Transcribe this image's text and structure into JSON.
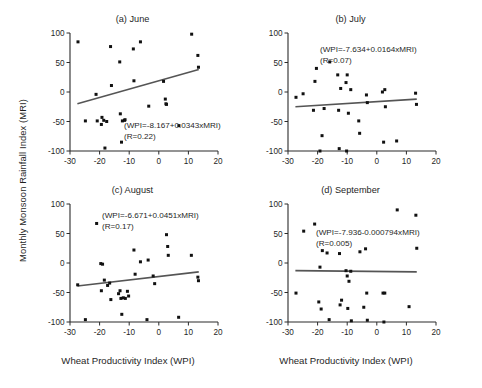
{
  "figure": {
    "xlabel": "Wheat Productivity Index (WPI)",
    "ylabel": "Monthly Monsoon Rainfall Index (MRI)",
    "axis_color": "#2b2b2b",
    "point_color": "#111111",
    "line_color": "#555555"
  },
  "chart_data": [
    {
      "type": "scatter",
      "title": "(a)  June",
      "panel_letter": "(a)",
      "month": "June",
      "xlabel": "Wheat Productivity Index (WPI)",
      "ylabel": "Monthly Monsoon Rainfall Index (MRI)",
      "xlim": [
        -30,
        20
      ],
      "ylim": [
        -100,
        100
      ],
      "xticks": [
        -30,
        -20,
        -10,
        0,
        10,
        20
      ],
      "yticks": [
        -100,
        -50,
        0,
        50,
        100
      ],
      "grid": false,
      "equation": "(WPI=-8.167+0.0343xMRI)",
      "r_text": "(R=0.22)",
      "r_value": 0.22,
      "fit_intercept": -8.167,
      "fit_slope": 0.0343,
      "trendline": {
        "x0": -27.5,
        "y0": -20,
        "x1": 13.5,
        "y1": 38
      },
      "points": [
        [
          -27.3,
          85
        ],
        [
          -24.8,
          -49
        ],
        [
          -21.2,
          -4
        ],
        [
          -20.8,
          -49
        ],
        [
          -19.4,
          -55
        ],
        [
          -19.2,
          -43
        ],
        [
          -18.6,
          -48
        ],
        [
          -18.2,
          -95
        ],
        [
          -17.6,
          -50
        ],
        [
          -16.3,
          77
        ],
        [
          -16.0,
          11
        ],
        [
          -13.2,
          51
        ],
        [
          -13.0,
          -37
        ],
        [
          -12.6,
          -85
        ],
        [
          -12.3,
          -49
        ],
        [
          -11.6,
          -48
        ],
        [
          -11.4,
          -47
        ],
        [
          -8.6,
          73
        ],
        [
          -8.4,
          19
        ],
        [
          -6.2,
          85
        ],
        [
          -3.4,
          -24
        ],
        [
          1.6,
          18
        ],
        [
          2.2,
          -12
        ],
        [
          2.4,
          -20
        ],
        [
          2.6,
          -21
        ],
        [
          6.8,
          -57
        ],
        [
          11.1,
          98
        ],
        [
          13.2,
          62
        ],
        [
          13.4,
          42
        ]
      ]
    },
    {
      "type": "scatter",
      "title": "(b)  July",
      "panel_letter": "(b)",
      "month": "July",
      "xlabel": "Wheat Productivity Index (WPI)",
      "ylabel": "Monthly Monsoon Rainfall Index (MRI)",
      "xlim": [
        -30,
        20
      ],
      "ylim": [
        -100,
        100
      ],
      "xticks": [
        -30,
        -20,
        -10,
        0,
        10,
        20
      ],
      "yticks": [
        -100,
        -50,
        0,
        50,
        100
      ],
      "grid": false,
      "equation": "(WPI=-7.634+0.0164xMRI)",
      "r_text": "(R=0.07)",
      "r_value": 0.07,
      "fit_intercept": -7.634,
      "fit_slope": 0.0164,
      "trendline": {
        "x0": -27.5,
        "y0": -25,
        "x1": 13.5,
        "y1": -12
      },
      "points": [
        [
          -27.3,
          -9
        ],
        [
          -24.9,
          -3
        ],
        [
          -21.4,
          -31
        ],
        [
          -20.9,
          18
        ],
        [
          -20.4,
          40
        ],
        [
          -19.2,
          -100
        ],
        [
          -18.5,
          -74
        ],
        [
          -17.8,
          -28
        ],
        [
          -15.9,
          51
        ],
        [
          -13.2,
          29
        ],
        [
          -12.9,
          -31
        ],
        [
          -12.7,
          -96
        ],
        [
          -12.2,
          6
        ],
        [
          -10.4,
          16
        ],
        [
          -10.2,
          -100
        ],
        [
          -10.0,
          29
        ],
        [
          -9.6,
          -36
        ],
        [
          -8.8,
          4
        ],
        [
          -6.1,
          -49
        ],
        [
          -5.8,
          -70
        ],
        [
          -3.5,
          -5
        ],
        [
          -3.2,
          -18
        ],
        [
          1.9,
          0
        ],
        [
          2.3,
          -85
        ],
        [
          2.7,
          4
        ],
        [
          2.9,
          -25
        ],
        [
          6.7,
          -83
        ],
        [
          13.1,
          -2
        ],
        [
          13.4,
          -21
        ]
      ]
    },
    {
      "type": "scatter",
      "title": "(c)  August",
      "panel_letter": "(c)",
      "month": "August",
      "xlabel": "Wheat Productivity Index (WPI)",
      "ylabel": "Monthly Monsoon Rainfall Index (MRI)",
      "xlim": [
        -30,
        20
      ],
      "ylim": [
        -100,
        100
      ],
      "xticks": [
        -30,
        -20,
        -10,
        0,
        10,
        20
      ],
      "yticks": [
        -100,
        -50,
        0,
        50,
        100
      ],
      "grid": false,
      "equation": "(WPI=-6.671+0.0451xMRI)",
      "r_text": "(R=0.17)",
      "r_value": 0.17,
      "fit_intercept": -6.671,
      "fit_slope": 0.0451,
      "trendline": {
        "x0": -27.5,
        "y0": -39,
        "x1": 13.5,
        "y1": -15
      },
      "points": [
        [
          -27.4,
          -37
        ],
        [
          -24.8,
          -96
        ],
        [
          -21.0,
          67
        ],
        [
          -19.6,
          -1
        ],
        [
          -19.4,
          -47
        ],
        [
          -19.0,
          -2
        ],
        [
          -18.4,
          -29
        ],
        [
          -17.3,
          -38
        ],
        [
          -16.6,
          -34
        ],
        [
          -16.2,
          -62
        ],
        [
          -13.6,
          -52
        ],
        [
          -13.1,
          -47
        ],
        [
          -12.8,
          -60
        ],
        [
          -12.5,
          -87
        ],
        [
          -12.0,
          -59
        ],
        [
          -11.3,
          -60
        ],
        [
          -10.6,
          -48
        ],
        [
          -10.2,
          -56
        ],
        [
          -8.4,
          22
        ],
        [
          -8.0,
          -19
        ],
        [
          -6.2,
          2
        ],
        [
          -4.0,
          -96
        ],
        [
          -3.6,
          5
        ],
        [
          -1.9,
          -22
        ],
        [
          -1.4,
          -35
        ],
        [
          2.6,
          48
        ],
        [
          3.0,
          28
        ],
        [
          3.2,
          13
        ],
        [
          6.7,
          -92
        ],
        [
          11.0,
          13
        ],
        [
          13.2,
          -24
        ],
        [
          13.4,
          -30
        ]
      ]
    },
    {
      "type": "scatter",
      "title": "(d)  September",
      "panel_letter": "(d)",
      "month": "September",
      "xlabel": "Wheat Productivity Index (WPI)",
      "ylabel": "Monthly Monsoon Rainfall Index (MRI)",
      "xlim": [
        -30,
        20
      ],
      "ylim": [
        -100,
        100
      ],
      "xticks": [
        -30,
        -20,
        -10,
        0,
        10,
        20
      ],
      "yticks": [
        -100,
        -50,
        0,
        50,
        100
      ],
      "grid": false,
      "equation": "(WPI=-7.936-0.000794xMRI)",
      "r_text": "(R=0.005)",
      "r_value": 0.005,
      "fit_intercept": -7.936,
      "fit_slope": -0.000794,
      "trendline": {
        "x0": -27.5,
        "y0": -13,
        "x1": 13.5,
        "y1": -15
      },
      "points": [
        [
          -27.3,
          -51
        ],
        [
          -24.7,
          54
        ],
        [
          -21.0,
          66
        ],
        [
          -19.6,
          -66
        ],
        [
          -19.2,
          -7
        ],
        [
          -18.8,
          -78
        ],
        [
          -18.4,
          21
        ],
        [
          -16.8,
          17
        ],
        [
          -16.1,
          -96
        ],
        [
          -12.6,
          16
        ],
        [
          -12.4,
          -71
        ],
        [
          -11.9,
          -63
        ],
        [
          -10.4,
          -13
        ],
        [
          -10.0,
          -22
        ],
        [
          -9.8,
          -77
        ],
        [
          -9.4,
          -31
        ],
        [
          -8.8,
          -14
        ],
        [
          -8.6,
          -98
        ],
        [
          -5.7,
          19
        ],
        [
          -4.4,
          -75
        ],
        [
          -3.8,
          24
        ],
        [
          -3.4,
          -51
        ],
        [
          -3.2,
          -97
        ],
        [
          2.1,
          -51
        ],
        [
          2.4,
          -100
        ],
        [
          2.7,
          -51
        ],
        [
          6.9,
          90
        ],
        [
          10.9,
          -74
        ],
        [
          13.2,
          81
        ],
        [
          13.5,
          25
        ]
      ]
    }
  ]
}
